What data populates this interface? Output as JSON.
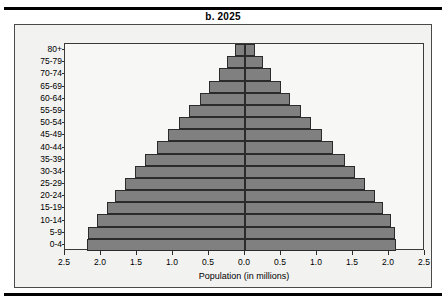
{
  "figure": {
    "title": "b. 2025",
    "male_label": "Male",
    "female_label": "Female"
  },
  "axes": {
    "x_title": "Population (in millions)",
    "x_ticks": [
      "2.5",
      "2.0",
      "1.5",
      "1.0",
      "0.5",
      "0.0",
      "0.5",
      "1.0",
      "1.5",
      "2.0",
      "2.5"
    ],
    "x_tick_values": [
      -2.5,
      -2.0,
      -1.5,
      -1.0,
      -0.5,
      0.0,
      0.5,
      1.0,
      1.5,
      2.0,
      2.5
    ],
    "x_min": -2.5,
    "x_max": 2.5,
    "y_title": ""
  },
  "colors": {
    "bar_fill": "#808080",
    "bar_border": "#2b2b2b",
    "plot_background": "#f7f7f5",
    "panel_background": "#f2f2f0",
    "text": "#000000"
  },
  "chart_data": {
    "type": "bar",
    "subtype": "population-pyramid",
    "title": "b. 2025",
    "xlabel": "Population (in millions)",
    "ylabel": "",
    "xlim": [
      -2.5,
      2.5
    ],
    "grid": false,
    "legend_position": "inline-top-corners",
    "categories": [
      "80+",
      "75-79",
      "70-74",
      "65-69",
      "60-64",
      "55-59",
      "50-54",
      "45-49",
      "40-44",
      "35-39",
      "30-34",
      "25-29",
      "20-24",
      "15-19",
      "10-14",
      "5-9",
      "0-4"
    ],
    "series": [
      {
        "name": "Male",
        "direction": "left",
        "values": [
          0.14,
          0.25,
          0.36,
          0.5,
          0.63,
          0.78,
          0.92,
          1.07,
          1.22,
          1.39,
          1.53,
          1.66,
          1.8,
          1.92,
          2.06,
          2.18,
          2.2
        ]
      },
      {
        "name": "Female",
        "direction": "right",
        "values": [
          0.14,
          0.25,
          0.36,
          0.5,
          0.63,
          0.78,
          0.92,
          1.07,
          1.22,
          1.39,
          1.53,
          1.66,
          1.8,
          1.92,
          2.03,
          2.09,
          2.1
        ]
      }
    ]
  }
}
